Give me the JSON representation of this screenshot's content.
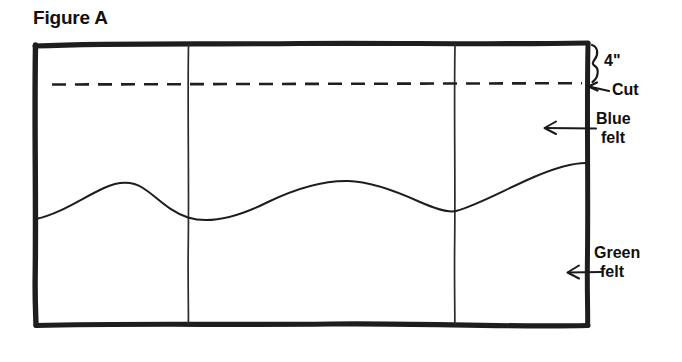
{
  "figure": {
    "title": "Figure A",
    "type": "hand-drawn-diagram",
    "background_color": "#ffffff",
    "ink_color": "#1a1a1a"
  },
  "annotations": {
    "top_measure": {
      "name": "four-inch-measure",
      "text": "4\"",
      "marker": "curly-brace",
      "description": "brace spanning top edge down to cut line"
    },
    "cut": {
      "name": "cut-line",
      "text": "Cut",
      "marker": "arrow-left",
      "line_style": "dashed"
    },
    "blue_felt": {
      "name": "blue-felt-region",
      "line1": "Blue",
      "line2": "felt",
      "marker": "arrow-left",
      "color_hex": "#1f4fa3"
    },
    "green_felt": {
      "name": "green-felt-region",
      "line1": "Green",
      "line2": "felt",
      "marker": "arrow-left",
      "color_hex": "#2e7d32"
    }
  },
  "panel": {
    "outline": "hand-drawn rectangle",
    "divider_count": 2,
    "wavy_seam": "hand-drawn wavy line separating blue felt from green felt"
  }
}
